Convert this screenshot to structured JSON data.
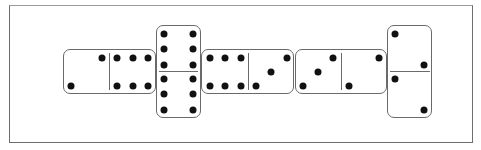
{
  "board": {
    "frame": {
      "border_color": "#6e6e6e",
      "background": "#ffffff"
    },
    "pip_color": "#111111",
    "dominoes": [
      {
        "id": "d1",
        "orientation": "horizontal",
        "values": [
          2,
          6
        ],
        "label": "2-6"
      },
      {
        "id": "d2",
        "orientation": "vertical",
        "values": [
          6,
          6
        ],
        "label": "6-6"
      },
      {
        "id": "d3",
        "orientation": "horizontal",
        "values": [
          6,
          3
        ],
        "label": "6-3"
      },
      {
        "id": "d4",
        "orientation": "horizontal",
        "values": [
          3,
          2
        ],
        "label": "3-2"
      },
      {
        "id": "d5",
        "orientation": "vertical",
        "values": [
          2,
          2
        ],
        "label": "2-2"
      }
    ]
  }
}
